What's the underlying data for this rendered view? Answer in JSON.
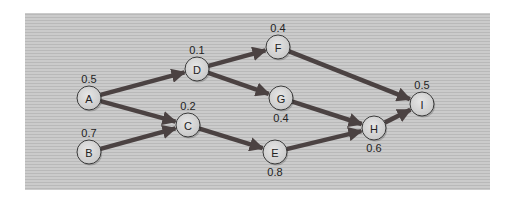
{
  "diagram": {
    "type": "weighted-directed-graph",
    "colors": {
      "panel_bg": "#c9c9c9",
      "stripe": "#bdbdbd",
      "edge": "#4b4242",
      "node_fill": "#dadada",
      "node_stroke": "#3a3a3a",
      "text": "#222222"
    },
    "nodes": [
      {
        "id": "A",
        "label": "A",
        "x": 89,
        "y": 98,
        "weight": "0.5",
        "weight_pos": "above"
      },
      {
        "id": "B",
        "label": "B",
        "x": 89,
        "y": 152,
        "weight": "0.7",
        "weight_pos": "above"
      },
      {
        "id": "C",
        "label": "C",
        "x": 188,
        "y": 125,
        "weight": "0.2",
        "weight_pos": "above"
      },
      {
        "id": "D",
        "label": "D",
        "x": 197,
        "y": 69,
        "weight": "0.1",
        "weight_pos": "above"
      },
      {
        "id": "E",
        "label": "E",
        "x": 275,
        "y": 152,
        "weight": "0.8",
        "weight_pos": "below"
      },
      {
        "id": "F",
        "label": "F",
        "x": 278,
        "y": 47,
        "weight": "0.4",
        "weight_pos": "above"
      },
      {
        "id": "G",
        "label": "G",
        "x": 281,
        "y": 98,
        "weight": "0.4",
        "weight_pos": "below"
      },
      {
        "id": "H",
        "label": "H",
        "x": 374,
        "y": 128,
        "weight": "0.6",
        "weight_pos": "below"
      },
      {
        "id": "I",
        "label": "I",
        "x": 422,
        "y": 104,
        "weight": "0.5",
        "weight_pos": "above"
      }
    ],
    "edges": [
      {
        "from": "A",
        "to": "D"
      },
      {
        "from": "A",
        "to": "C"
      },
      {
        "from": "B",
        "to": "C"
      },
      {
        "from": "D",
        "to": "F"
      },
      {
        "from": "D",
        "to": "G"
      },
      {
        "from": "C",
        "to": "E"
      },
      {
        "from": "F",
        "to": "I"
      },
      {
        "from": "G",
        "to": "H"
      },
      {
        "from": "E",
        "to": "H"
      },
      {
        "from": "H",
        "to": "I"
      }
    ]
  }
}
